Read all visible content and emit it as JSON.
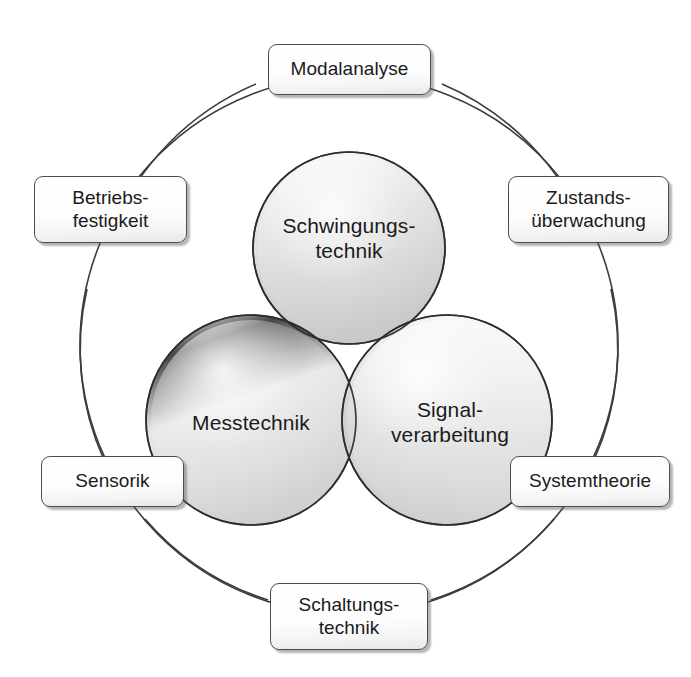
{
  "diagram": {
    "background_color": "#ffffff",
    "outer_ring": {
      "stroke_color": "#3a3a3a",
      "center_x": 349,
      "center_y": 345,
      "radius": 269
    },
    "venn": {
      "fill_color": "#c9c9c9",
      "stroke_color": "#3a3a3a",
      "circles": [
        {
          "id": "schwingungstechnik",
          "label": "Schwingungs-\ntechnik",
          "center_x": 349,
          "center_y": 248,
          "radius": 96
        },
        {
          "id": "messtechnik",
          "label": "Messtechnik",
          "center_x": 251,
          "center_y": 420,
          "radius": 105
        },
        {
          "id": "signalverarbeitung",
          "label": "Signal-\nverarbeitung",
          "center_x": 447,
          "center_y": 420,
          "radius": 105
        }
      ]
    },
    "nodes": [
      {
        "id": "modalanalyse",
        "label": "Modalanalyse"
      },
      {
        "id": "betriebsfestigkeit",
        "label": "Betriebs-\nfestigkeit"
      },
      {
        "id": "zustandsueberwachung",
        "label": "Zustands-\nüberwachung"
      },
      {
        "id": "sensorik",
        "label": "Sensorik"
      },
      {
        "id": "systemtheorie",
        "label": "Systemtheorie"
      },
      {
        "id": "schaltungstechnik",
        "label": "Schaltungs-\ntechnik"
      }
    ],
    "connectors": [
      {
        "from": "modalanalyse",
        "to": "betriebsfestigkeit"
      },
      {
        "from": "betriebsfestigkeit",
        "to": "sensorik"
      },
      {
        "from": "sensorik",
        "to": "schaltungstechnik"
      },
      {
        "from": "schaltungstechnik",
        "to": "systemtheorie"
      },
      {
        "from": "systemtheorie",
        "to": "zustandsueberwachung"
      },
      {
        "from": "zustandsueberwachung",
        "to": "modalanalyse"
      }
    ]
  }
}
